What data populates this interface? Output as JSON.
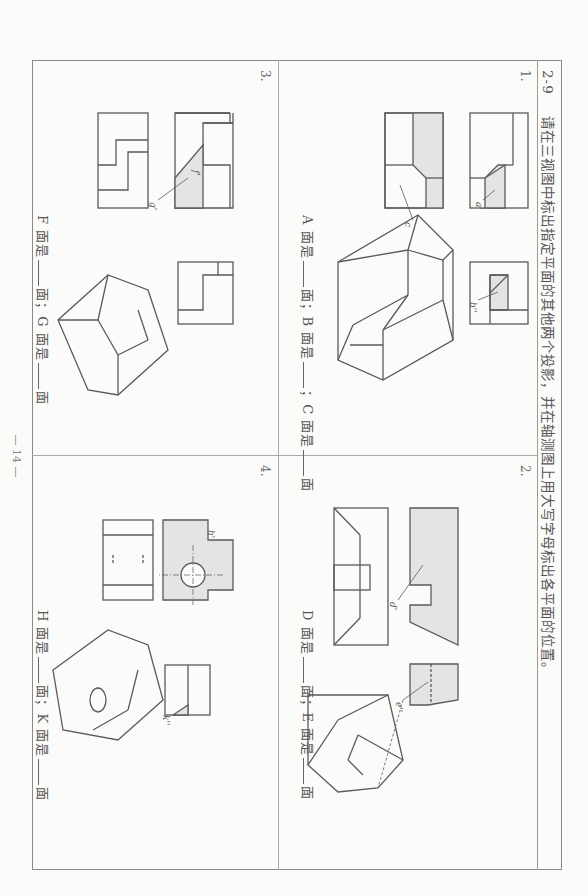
{
  "header": {
    "exercise_number": "2-9",
    "instruction": "请在三视图中标出指定平面的其他两个投影，并在轴测图上用大写字母标出各平面的位置。"
  },
  "problems": [
    {
      "number": "1.",
      "labels": [
        "a'",
        "b''",
        "c"
      ],
      "answer": {
        "p1": "A 面是",
        "p2": "面；B 面是",
        "p3": "；C 面是",
        "p4": "面"
      }
    },
    {
      "number": "2.",
      "labels": [
        "d'",
        "e''"
      ],
      "answer": {
        "p1": "D 面是",
        "p2": "面；E 面是",
        "p3": "面"
      }
    },
    {
      "number": "3.",
      "labels": [
        "f'",
        "g'"
      ],
      "answer": {
        "p1": "F 面是",
        "p2": "面；G 面是",
        "p3": "面"
      }
    },
    {
      "number": "4.",
      "labels": [
        "h'",
        "k''"
      ],
      "answer": {
        "p1": "H 面是",
        "p2": "面；K 面是",
        "p3": "面"
      }
    }
  ],
  "footer": {
    "page_number": "— 14 —"
  },
  "colors": {
    "line": "#5a5a5a",
    "fill": "#e4e4e4",
    "frame": "#8a8a8a"
  }
}
